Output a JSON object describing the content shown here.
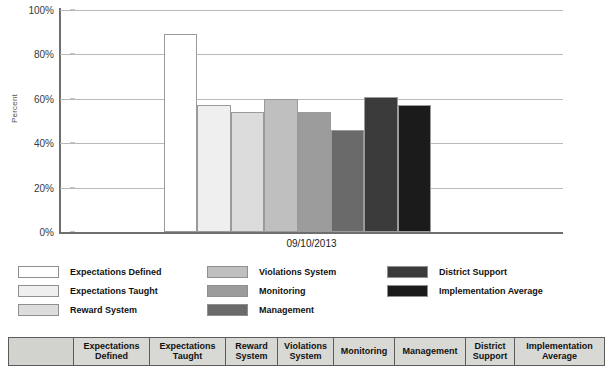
{
  "chart_data": {
    "type": "bar",
    "title": "",
    "subtitle": "",
    "xlabel": "09/10/2013",
    "ylabel": "Percent",
    "categories": [
      "Expectations Defined",
      "Expectations Taught",
      "Reward System",
      "Violations System",
      "Monitoring",
      "Management",
      "District Support",
      "Implementation Average"
    ],
    "values": [
      89,
      57,
      54,
      60,
      54,
      46,
      61,
      57
    ],
    "value_labels": [
      "89%",
      "57%",
      "54%",
      "60%",
      "54%",
      "46%",
      "61%",
      "57%"
    ],
    "colors": [
      "#ffffff",
      "#efefef",
      "#dcdcdc",
      "#bfbfbf",
      "#9c9c9c",
      "#6a6a6a",
      "#3b3b3b",
      "#1b1b1b"
    ],
    "ylim": [
      0,
      100
    ],
    "y_ticks": [
      0,
      20,
      40,
      60,
      80,
      100
    ],
    "y_tick_labels": [
      "0%",
      "20%",
      "40%",
      "60%",
      "80%",
      "100%"
    ],
    "x_tick_labels": [
      "09/10/2013"
    ],
    "grid": true,
    "grid_axis": "y",
    "legend_position": "bottom",
    "axis_color": "#6e6e6e",
    "grid_color": "#b9b9b9"
  },
  "legend": {
    "columns": [
      {
        "items": [
          {
            "label": "Expectations Defined",
            "color": "#ffffff"
          },
          {
            "label": "Expectations Taught",
            "color": "#efefef"
          },
          {
            "label": "Reward System",
            "color": "#dcdcdc"
          }
        ]
      },
      {
        "items": [
          {
            "label": "Violations System",
            "color": "#bfbfbf"
          },
          {
            "label": "Monitoring",
            "color": "#9c9c9c"
          },
          {
            "label": "Management",
            "color": "#6a6a6a"
          }
        ]
      },
      {
        "items": [
          {
            "label": "District Support",
            "color": "#3b3b3b"
          },
          {
            "label": "Implementation Average",
            "color": "#1b1b1b"
          }
        ]
      }
    ]
  },
  "table": {
    "corner_header": "",
    "headers": [
      "Expectations Defined",
      "Expectations Taught",
      "Reward System",
      "Violations System",
      "Monitoring",
      "Management",
      "District Support",
      "Implementation Average"
    ]
  }
}
